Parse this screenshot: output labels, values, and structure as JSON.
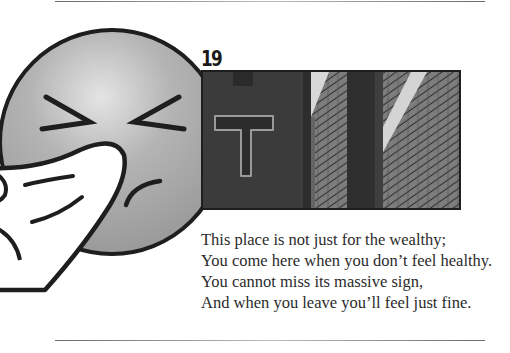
{
  "page": {
    "puzzle_number": "19",
    "poem_lines": [
      "This place is not just for the wealthy;",
      "You come here when you don’t feel healthy.",
      "You cannot miss its massive sign,",
      "And when you leave you’ll feel just fine."
    ],
    "illustration": "sneezing-face-emoji",
    "photo": "brick-building-with-T-sign",
    "colors": {
      "emoji_fill": "#a9a9a9",
      "outline": "#1e1e1e",
      "text": "#2b2b2b",
      "rule": "#6a6a6a"
    }
  }
}
